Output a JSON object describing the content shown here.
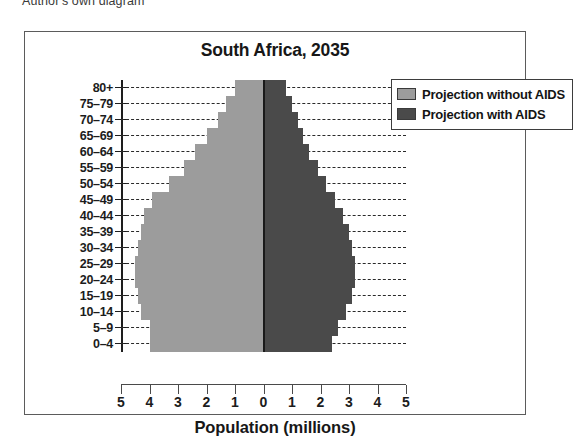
{
  "caption": "Author's own diagram",
  "chart_data": {
    "type": "bar",
    "subtype": "population-pyramid",
    "title": "South Africa, 2035",
    "xlabel": "Population (millions)",
    "ylabel": "",
    "xlim": [
      -5,
      5
    ],
    "x_tick_labels": [
      "5",
      "4",
      "3",
      "2",
      "1",
      "0",
      "1",
      "2",
      "3",
      "4",
      "5"
    ],
    "x_tick_values": [
      -5,
      -4,
      -3,
      -2,
      -1,
      0,
      1,
      2,
      3,
      4,
      5
    ],
    "grid": "horizontal-dashed",
    "legend_position": "top-right",
    "categories": [
      "80+",
      "75–79",
      "70–74",
      "65–69",
      "60–64",
      "55–59",
      "50–54",
      "45–49",
      "40–44",
      "35–39",
      "30–34",
      "25–29",
      "20–24",
      "15–19",
      "10–14",
      "5–9",
      "0–4"
    ],
    "series": [
      {
        "name": "Projection without AIDS",
        "side": "left",
        "color": "#9c9c9c",
        "values": [
          1.0,
          1.3,
          1.6,
          2.0,
          2.4,
          2.8,
          3.3,
          3.9,
          4.2,
          4.3,
          4.4,
          4.5,
          4.5,
          4.4,
          4.3,
          4.0,
          4.0
        ]
      },
      {
        "name": "Projection with AIDS",
        "side": "right",
        "color": "#4a4a4a",
        "values": [
          0.8,
          1.0,
          1.2,
          1.4,
          1.6,
          1.9,
          2.2,
          2.5,
          2.8,
          3.0,
          3.1,
          3.2,
          3.2,
          3.1,
          2.9,
          2.6,
          2.4
        ]
      }
    ]
  },
  "legend": {
    "entries": [
      {
        "label": "Projection without AIDS",
        "swatch": "light-gray-swatch"
      },
      {
        "label": "Projection with AIDS",
        "swatch": "dark-gray-swatch"
      }
    ]
  }
}
